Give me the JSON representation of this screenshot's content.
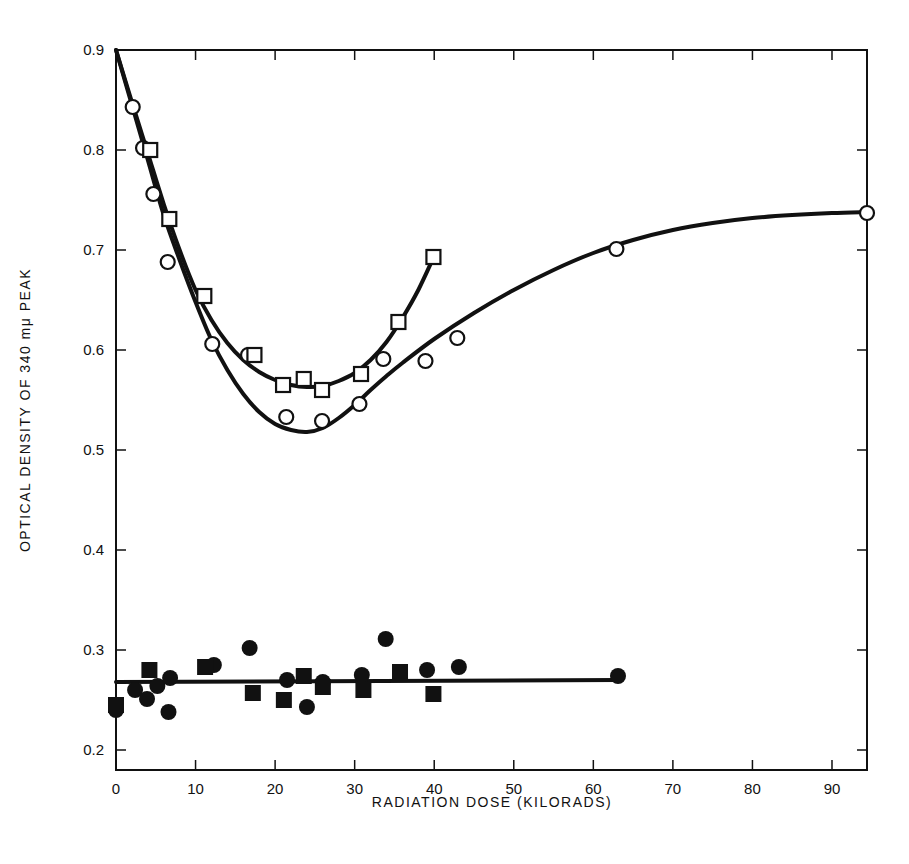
{
  "chart_data": {
    "type": "scatter",
    "title": "",
    "xlabel": "RADIATION DOSE (KILORADS)",
    "ylabel": "OPTICAL DENSITY OF 340 mμ PEAK",
    "xlim": [
      0,
      94.4
    ],
    "ylim": [
      0.18,
      0.9
    ],
    "grid": false,
    "legend": null,
    "x_ticks": [
      0,
      10,
      20,
      30,
      40,
      50,
      60,
      70,
      80,
      90
    ],
    "x_tick_labels": [
      "0",
      "10",
      "20",
      "30",
      "40",
      "50",
      "60",
      "70",
      "80",
      "90"
    ],
    "y_ticks": [
      0.2,
      0.3,
      0.4,
      0.5,
      0.6,
      0.7,
      0.8,
      0.9
    ],
    "y_tick_labels": [
      "0.2",
      "0.3",
      "0.4",
      "0.5",
      "0.6",
      "0.7",
      "0.8",
      "0.9"
    ],
    "series": [
      {
        "name": "open circles",
        "marker": "circle-open",
        "x": [
          2.1,
          3.4,
          4.7,
          6.5,
          12.1,
          16.6,
          21.4,
          25.9,
          30.6,
          33.6,
          38.9,
          42.9,
          62.9,
          94.4
        ],
        "y": [
          0.843,
          0.802,
          0.756,
          0.688,
          0.606,
          0.595,
          0.533,
          0.529,
          0.546,
          0.591,
          0.589,
          0.612,
          0.701,
          0.737
        ]
      },
      {
        "name": "open squares",
        "marker": "square-open",
        "x": [
          4.3,
          6.7,
          11.1,
          17.4,
          21.0,
          23.6,
          25.9,
          30.8,
          35.5,
          39.9
        ],
        "y": [
          0.8,
          0.731,
          0.654,
          0.595,
          0.565,
          0.571,
          0.56,
          0.576,
          0.628,
          0.693
        ]
      },
      {
        "name": "filled circles",
        "marker": "circle-filled",
        "x": [
          0.0,
          2.4,
          3.9,
          5.2,
          6.6,
          6.8,
          12.3,
          16.8,
          21.5,
          24.0,
          26.0,
          30.9,
          33.9,
          39.1,
          43.1,
          63.1
        ],
        "y": [
          0.24,
          0.26,
          0.251,
          0.264,
          0.238,
          0.272,
          0.285,
          0.302,
          0.27,
          0.243,
          0.268,
          0.275,
          0.311,
          0.28,
          0.283,
          0.274
        ]
      },
      {
        "name": "filled squares",
        "marker": "square-filled",
        "x": [
          0.0,
          4.2,
          11.2,
          17.2,
          21.1,
          23.6,
          26.0,
          31.1,
          35.7,
          39.9
        ],
        "y": [
          0.245,
          0.28,
          0.283,
          0.257,
          0.25,
          0.274,
          0.263,
          0.26,
          0.278,
          0.256
        ]
      }
    ],
    "fit_curves": [
      {
        "name": "open-circle fit",
        "x": [
          0,
          2,
          4,
          6,
          8,
          10,
          12,
          14,
          16,
          18,
          20,
          22,
          24,
          26,
          28,
          30,
          32,
          34,
          36,
          40,
          45,
          50,
          55,
          60,
          65,
          70,
          75,
          80,
          85,
          90,
          94.4
        ],
        "y": [
          0.9,
          0.845,
          0.79,
          0.735,
          0.69,
          0.648,
          0.61,
          0.58,
          0.556,
          0.538,
          0.526,
          0.52,
          0.518,
          0.522,
          0.532,
          0.545,
          0.56,
          0.574,
          0.587,
          0.611,
          0.637,
          0.66,
          0.68,
          0.697,
          0.71,
          0.72,
          0.727,
          0.732,
          0.735,
          0.737,
          0.738
        ]
      },
      {
        "name": "open-square fit",
        "x": [
          0,
          2,
          4,
          6,
          8,
          10,
          12,
          14,
          16,
          18,
          20,
          22,
          24,
          26,
          28,
          30,
          32,
          34,
          36,
          38,
          40
        ],
        "y": [
          0.9,
          0.848,
          0.797,
          0.746,
          0.7,
          0.66,
          0.63,
          0.607,
          0.59,
          0.578,
          0.57,
          0.565,
          0.563,
          0.564,
          0.569,
          0.577,
          0.59,
          0.608,
          0.632,
          0.66,
          0.694
        ]
      },
      {
        "name": "filled fit (linear)",
        "x": [
          0,
          63.1
        ],
        "y": [
          0.268,
          0.27
        ]
      }
    ]
  },
  "axes": {
    "x_title": "RADIATION DOSE (KILORADS)",
    "y_title": "OPTICAL DENSITY OF 340 mμ PEAK"
  },
  "colors": {
    "ink": "#111111",
    "background": "#ffffff"
  }
}
